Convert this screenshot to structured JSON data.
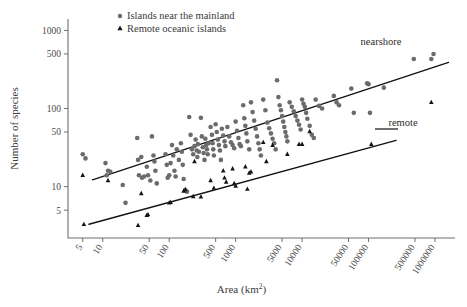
{
  "figure": {
    "background": "#ffffff",
    "marker_colors": {
      "nearshore_circle": "#6b6b6b",
      "remote_triangle": "#141414",
      "line": "#111111",
      "axis": "#6f6f6f"
    }
  },
  "legend": {
    "position": "top-center",
    "items": [
      {
        "marker": "circle-marker",
        "label": "Islands near the mainland"
      },
      {
        "marker": "triangle-marker",
        "label": "Remote oceanic islands"
      }
    ]
  },
  "annotations": [
    {
      "name": "nearshore-fit-label",
      "text": "nearshore"
    },
    {
      "name": "remote-fit-label",
      "text": "remote"
    }
  ],
  "chart_data": {
    "type": "scatter",
    "title": "",
    "xlabel": "Area (km2)",
    "xlabel_base": "Area (km",
    "xlabel_exponent": "2",
    "xlabel_close": ")",
    "ylabel": "Number of species",
    "xscale": "log",
    "yscale": "log",
    "xlim": [
      3.0,
      2000000
    ],
    "ylim": [
      2.2,
      1400
    ],
    "grid": false,
    "legend_position": "top-center",
    "xticks": [
      5,
      10,
      50,
      100,
      500,
      1000,
      5000,
      10000,
      50000,
      100000,
      500000,
      1000000
    ],
    "xticklabels": [
      "5",
      "10",
      "50",
      "100",
      "500",
      "1000",
      "5000",
      "10000",
      "50000",
      "100000",
      "500000",
      "1000000"
    ],
    "yticks": [
      5,
      10,
      50,
      100,
      500,
      1000
    ],
    "yticklabels": [
      "5",
      "10",
      "50",
      "100",
      "500",
      "1000"
    ],
    "series": [
      {
        "name": "Islands near the mainland",
        "marker": "circle",
        "color": "#6b6b6b",
        "points": [
          [
            5,
            26
          ],
          [
            5.5,
            23
          ],
          [
            11,
            20
          ],
          [
            12,
            16
          ],
          [
            13,
            15.5
          ],
          [
            11.5,
            14
          ],
          [
            20,
            10.5
          ],
          [
            22,
            6.2
          ],
          [
            33,
            42
          ],
          [
            34,
            22
          ],
          [
            38,
            24
          ],
          [
            35,
            14
          ],
          [
            39,
            13
          ],
          [
            42,
            13.5
          ],
          [
            46,
            18
          ],
          [
            48,
            14
          ],
          [
            52,
            12
          ],
          [
            55,
            44
          ],
          [
            58,
            25
          ],
          [
            60,
            21
          ],
          [
            62,
            16
          ],
          [
            65,
            11
          ],
          [
            88,
            26
          ],
          [
            92,
            19
          ],
          [
            95,
            13
          ],
          [
            100,
            14
          ],
          [
            105,
            20
          ],
          [
            110,
            34
          ],
          [
            115,
            25
          ],
          [
            120,
            16
          ],
          [
            125,
            13.5
          ],
          [
            130,
            30
          ],
          [
            140,
            22
          ],
          [
            150,
            36
          ],
          [
            155,
            28
          ],
          [
            160,
            19
          ],
          [
            165,
            12.5
          ],
          [
            175,
            9
          ],
          [
            185,
            8.6
          ],
          [
            200,
            78
          ],
          [
            210,
            46
          ],
          [
            220,
            30
          ],
          [
            230,
            26
          ],
          [
            240,
            33
          ],
          [
            250,
            40
          ],
          [
            260,
            29
          ],
          [
            265,
            24
          ],
          [
            270,
            35
          ],
          [
            280,
            28
          ],
          [
            300,
            76
          ],
          [
            310,
            44
          ],
          [
            320,
            32
          ],
          [
            330,
            27
          ],
          [
            340,
            22
          ],
          [
            350,
            41
          ],
          [
            360,
            34
          ],
          [
            370,
            30
          ],
          [
            380,
            26
          ],
          [
            390,
            36
          ],
          [
            420,
            58
          ],
          [
            440,
            46
          ],
          [
            450,
            36
          ],
          [
            460,
            30
          ],
          [
            470,
            25
          ],
          [
            500,
            63
          ],
          [
            520,
            50
          ],
          [
            540,
            40
          ],
          [
            560,
            34
          ],
          [
            580,
            29
          ],
          [
            600,
            22
          ],
          [
            620,
            55
          ],
          [
            650,
            45
          ],
          [
            680,
            38
          ],
          [
            700,
            33
          ],
          [
            750,
            58
          ],
          [
            800,
            44
          ],
          [
            850,
            37
          ],
          [
            900,
            34
          ],
          [
            950,
            31
          ],
          [
            1000,
            68
          ],
          [
            1050,
            52
          ],
          [
            1100,
            42
          ],
          [
            1150,
            35
          ],
          [
            1200,
            33
          ],
          [
            1300,
            110
          ],
          [
            1350,
            75
          ],
          [
            1400,
            60
          ],
          [
            1450,
            48
          ],
          [
            1500,
            38
          ],
          [
            1600,
            30
          ],
          [
            1700,
            120
          ],
          [
            1800,
            90
          ],
          [
            1900,
            70
          ],
          [
            2000,
            55
          ],
          [
            2100,
            44
          ],
          [
            2200,
            36
          ],
          [
            2300,
            30
          ],
          [
            2400,
            25
          ],
          [
            2600,
            130
          ],
          [
            2800,
            95
          ],
          [
            3000,
            66
          ],
          [
            3200,
            56
          ],
          [
            3400,
            48
          ],
          [
            3600,
            41
          ],
          [
            3800,
            36
          ],
          [
            4000,
            30
          ],
          [
            4200,
            230
          ],
          [
            4400,
            140
          ],
          [
            4600,
            110
          ],
          [
            4800,
            95
          ],
          [
            5000,
            80
          ],
          [
            5200,
            68
          ],
          [
            5400,
            58
          ],
          [
            5600,
            50
          ],
          [
            5800,
            44
          ],
          [
            6000,
            38
          ],
          [
            6500,
            120
          ],
          [
            7000,
            105
          ],
          [
            7500,
            92
          ],
          [
            8000,
            80
          ],
          [
            8500,
            70
          ],
          [
            9000,
            62
          ],
          [
            9500,
            54
          ],
          [
            10000,
            130
          ],
          [
            10500,
            115
          ],
          [
            11000,
            105
          ],
          [
            11500,
            88
          ],
          [
            12000,
            74
          ],
          [
            13000,
            60
          ],
          [
            14000,
            46
          ],
          [
            15000,
            42
          ],
          [
            16000,
            130
          ],
          [
            18000,
            108
          ],
          [
            20000,
            100
          ],
          [
            30000,
            145
          ],
          [
            33000,
            120
          ],
          [
            36000,
            110
          ],
          [
            55000,
            180
          ],
          [
            60000,
            88
          ],
          [
            95000,
            210
          ],
          [
            100000,
            205
          ],
          [
            105000,
            88
          ],
          [
            170000,
            185
          ],
          [
            480000,
            430
          ],
          [
            880000,
            430
          ],
          [
            950000,
            500
          ]
        ]
      },
      {
        "name": "Remote oceanic islands",
        "marker": "triangle",
        "color": "#141414",
        "points": [
          [
            5,
            14
          ],
          [
            5.2,
            3.3
          ],
          [
            12,
            12
          ],
          [
            34,
            3.2
          ],
          [
            38,
            8.2
          ],
          [
            46,
            4.3
          ],
          [
            48,
            4.4
          ],
          [
            100,
            6.2
          ],
          [
            105,
            6.3
          ],
          [
            165,
            8.8
          ],
          [
            175,
            9.2
          ],
          [
            230,
            7.5
          ],
          [
            240,
            21
          ],
          [
            300,
            7.4
          ],
          [
            420,
            12
          ],
          [
            470,
            9.6
          ],
          [
            650,
            16
          ],
          [
            680,
            13
          ],
          [
            720,
            11.5
          ],
          [
            900,
            17
          ],
          [
            950,
            11
          ],
          [
            1000,
            10.2
          ],
          [
            1400,
            18
          ],
          [
            1500,
            9.3
          ],
          [
            1600,
            15
          ],
          [
            1700,
            15.5
          ],
          [
            2600,
            37
          ],
          [
            2900,
            21
          ],
          [
            3600,
            34
          ],
          [
            6000,
            26
          ],
          [
            9000,
            35
          ],
          [
            10000,
            35
          ],
          [
            13000,
            51
          ],
          [
            110000,
            35
          ],
          [
            880000,
            120
          ]
        ]
      }
    ],
    "fit_lines": [
      {
        "name": "nearshore",
        "label": "nearshore",
        "x0": 7,
        "y0": 12.2,
        "x1": 1600000,
        "y1": 390
      },
      {
        "name": "remote",
        "label": "remote",
        "x0": 6.2,
        "y0": 3.3,
        "x1": 260000,
        "y1": 39
      }
    ]
  }
}
